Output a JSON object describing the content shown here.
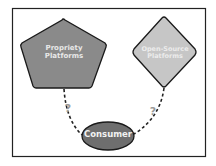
{
  "diagram": {
    "nodes": {
      "proprietary": {
        "label_line1": "Propriety",
        "label_line2": "Platforms",
        "shape": "pentagon",
        "fill": "#8a8a8a",
        "text_color": "#e8e8e8"
      },
      "open_source": {
        "label_line1": "Open-Source",
        "label_line2": "Platforms",
        "shape": "diamond",
        "fill": "#c6c6c6",
        "text_color": "#ececec"
      },
      "consumer": {
        "label": "Consumer",
        "shape": "ellipse",
        "fill": "#6e6e6e",
        "text_color": "#f2f2f2"
      }
    },
    "edges": [
      {
        "from": "consumer",
        "to": "proprietary",
        "style": "dashed",
        "label": "?"
      },
      {
        "from": "consumer",
        "to": "open_source",
        "style": "dashed",
        "label": "?"
      }
    ],
    "frame_color": "#222222",
    "question_color": "#999999"
  }
}
